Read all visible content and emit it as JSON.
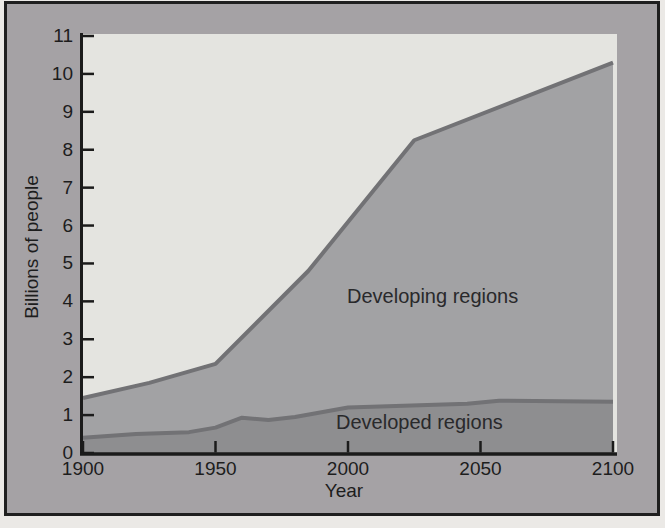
{
  "colors": {
    "page_bg": "#ebe9e6",
    "frame_border": "#1f1f1f",
    "panel_bg": "#a5a2a5",
    "plot_bg": "#e4e4e0",
    "developing_fill": "#a2a2a4",
    "developed_fill": "#8e8e90",
    "boundary_line": "#727275",
    "axis": "#1b1b1b",
    "text": "#1d1d1d"
  },
  "chart_data": {
    "type": "area",
    "stacked": true,
    "title": "",
    "xlabel": "Year",
    "ylabel": "Billions of people",
    "xlim": [
      1900,
      2100
    ],
    "ylim": [
      0,
      11
    ],
    "x_ticks": [
      1900,
      1950,
      2000,
      2050,
      2100
    ],
    "y_ticks": [
      0,
      1,
      2,
      3,
      4,
      5,
      6,
      7,
      8,
      9,
      10,
      11
    ],
    "grid": false,
    "legend_position": "labels drawn inside plot areas",
    "series": [
      {
        "name": "Developed regions",
        "points": [
          [
            1900,
            0.4
          ],
          [
            1920,
            0.5
          ],
          [
            1940,
            0.55
          ],
          [
            1950,
            0.67
          ],
          [
            1960,
            0.93
          ],
          [
            1970,
            0.87
          ],
          [
            1980,
            0.95
          ],
          [
            2000,
            1.2
          ],
          [
            2045,
            1.3
          ],
          [
            2057,
            1.38
          ],
          [
            2100,
            1.35
          ]
        ]
      },
      {
        "name": "Developing regions",
        "note": "stacked on top of Developed regions; points give the cumulative top boundary (world total)",
        "points": [
          [
            1900,
            1.45
          ],
          [
            1925,
            1.85
          ],
          [
            1950,
            2.35
          ],
          [
            1985,
            4.8
          ],
          [
            2025,
            8.25
          ],
          [
            2100,
            10.3
          ]
        ]
      }
    ],
    "annotations": [
      {
        "text": "Developing regions",
        "x": 2010,
        "y": 4.3
      },
      {
        "text": "Developed regions",
        "x": 2005,
        "y": 0.65
      }
    ]
  }
}
